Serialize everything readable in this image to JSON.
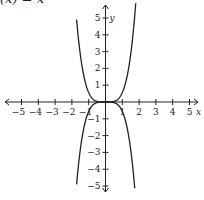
{
  "title": "(x) = x",
  "axes": {
    "x_label": "x",
    "y_label": "y"
  },
  "colors": {
    "axis": "#222222",
    "curve": "#222222"
  },
  "chart_data": {
    "type": "line",
    "title": "(x) = x",
    "xlabel": "x",
    "ylabel": "y",
    "xlim": [
      -5,
      5
    ],
    "ylim": [
      -5,
      5
    ],
    "x_ticks": [
      -5,
      -4,
      -3,
      -2,
      -1,
      1,
      2,
      3,
      4,
      5
    ],
    "y_ticks": [
      -5,
      -4,
      -3,
      -2,
      -1,
      1,
      2,
      3,
      4,
      5
    ],
    "grid": false,
    "series": [
      {
        "name": "upper curve",
        "x": [
          -1.7,
          -1.5,
          -1.2,
          -1,
          -0.5,
          0,
          0.5,
          1,
          1.2,
          1.5,
          1.8
        ],
        "y": [
          5.2,
          3.2,
          1.3,
          0.6,
          0.04,
          0,
          0.04,
          0.6,
          1.3,
          3.2,
          5.3
        ]
      },
      {
        "name": "lower curve",
        "x": [
          -1.7,
          -1.5,
          -1.2,
          -1,
          -0.5,
          0,
          0.5,
          1,
          1.2,
          1.5,
          1.75
        ],
        "y": [
          -5.1,
          -3.2,
          -1.3,
          -0.6,
          -0.04,
          0,
          -0.04,
          -0.6,
          -1.3,
          -3.2,
          -5.1
        ]
      }
    ]
  }
}
